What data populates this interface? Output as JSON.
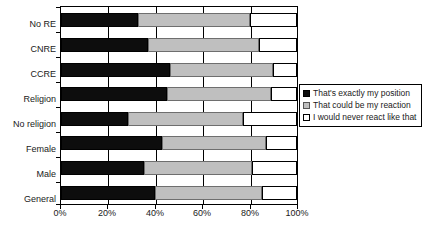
{
  "chart_data": {
    "type": "bar",
    "orientation": "horizontal",
    "stacked": true,
    "stack_mode": "percent",
    "title": "",
    "xlabel": "",
    "ylabel": "",
    "xlim": [
      0,
      100
    ],
    "xticks": [
      0,
      20,
      40,
      60,
      80,
      100
    ],
    "xticklabels": [
      "0%",
      "20%",
      "40%",
      "60%",
      "80%",
      "100%"
    ],
    "grid": true,
    "legend_position": "right",
    "categories": [
      "No RE",
      "CNRE",
      "CCRE",
      "Religion",
      "No religion",
      "Female",
      "Male",
      "General"
    ],
    "series": [
      {
        "name": "That's exactly my position",
        "color": "#0d0d0d",
        "values": [
          32.5,
          37,
          46,
          45,
          28.5,
          43,
          35,
          40
        ]
      },
      {
        "name": "That could be my reaction",
        "color": "#bfbfbf",
        "values": [
          47.5,
          47,
          44,
          44,
          48.5,
          44,
          46,
          45
        ]
      },
      {
        "name": "I would never react like that",
        "color": "#ffffff",
        "values": [
          20,
          16,
          10,
          11,
          23,
          13,
          19,
          15
        ]
      }
    ]
  },
  "legend": {
    "items": [
      {
        "label": "That's exactly my position"
      },
      {
        "label": "That could be my reaction"
      },
      {
        "label": "I would never react like that"
      }
    ]
  }
}
